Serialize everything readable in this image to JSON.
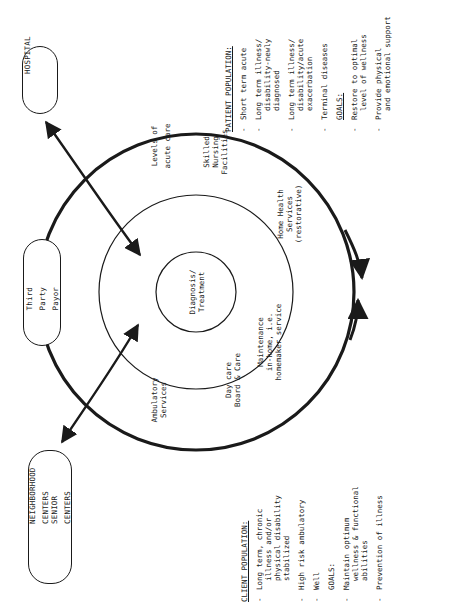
{
  "diagram": {
    "orientation": "rotated 90 degrees counter-clockwise",
    "center_circle": {
      "label_line1": "Diagnosis/",
      "label_line2": "Treatment"
    },
    "ring_labels": {
      "levels_acute_care": [
        "Levels of",
        "acute care"
      ],
      "skilled_nursing": [
        "Skilled",
        "Nursing",
        "Facilities"
      ],
      "home_health": [
        "Home Health",
        "Services",
        "(restorative)"
      ],
      "maintenance": [
        "Maintenance",
        "in-home, i.e.",
        "homemaker service"
      ],
      "day_care": [
        "Day care",
        "Board & Care"
      ],
      "ambulatory": [
        "Ambulatory",
        "Services"
      ]
    },
    "external_nodes": {
      "hospital": "HOSPITAL",
      "third_party_payor": "Third Party Payor",
      "neighborhood_centers": "NEIGHBORHOOD CENTERS",
      "senior_centers": "SENIOR CENTERS"
    },
    "patient_panel": {
      "header": "PATIENT POPULATION:",
      "items": [
        "Short term acute",
        "Long term illness/\n  disability-newly\n  diagnosed",
        "Long term illness/\n  disability/acute\n  exacerbation",
        "Terminal diseases"
      ],
      "goals_header": "GOALS:",
      "goals": [
        "Restore to optimal\n  level of wellness",
        "Provide physical\n  and emotional support"
      ]
    },
    "client_panel": {
      "header": "CLIENT POPULATION:",
      "items": [
        "Long term, chronic\n  illness and/or\n  physical disability\n  stabilized",
        "High risk ambulatory",
        "Well"
      ],
      "goals_header": "GOALS:",
      "goals": [
        "Maintain optimum\n  wellness & functional\n  abilities",
        "Prevention of illness"
      ]
    },
    "dash": "-",
    "line_color": "#1a1a1a"
  }
}
